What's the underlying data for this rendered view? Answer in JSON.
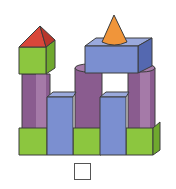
{
  "diagram": {
    "shapes": [
      {
        "type": "pyramid",
        "color": "red"
      },
      {
        "type": "cube",
        "color": "green"
      },
      {
        "type": "cone",
        "color": "orange"
      },
      {
        "type": "cuboid",
        "color": "blue"
      },
      {
        "type": "cylinder",
        "color": "purple",
        "count": 3
      },
      {
        "type": "tall-cuboid",
        "color": "blue",
        "count": 2
      },
      {
        "type": "cube",
        "color": "green",
        "count": 3
      }
    ],
    "answer_box": ""
  },
  "colors": {
    "red": "#d9473a",
    "green": "#8cc63f",
    "green_dark": "#6fa82e",
    "blue": "#7b8fd0",
    "blue_dark": "#5468b0",
    "purple": "#8a5c8f",
    "purple_light": "#a57aa8",
    "orange": "#f0953a",
    "outline": "#3c3c3c"
  }
}
